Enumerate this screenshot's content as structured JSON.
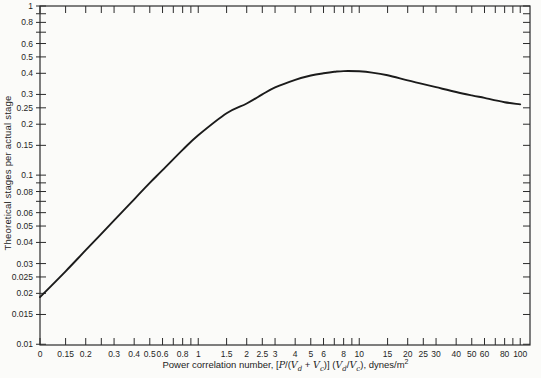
{
  "figure": {
    "y_axis_title": "Theoretical stages per actual stage",
    "x_axis_title": {
      "t1": "Power correlation number, [",
      "P1": "P",
      "t2": "/(",
      "V1": "V",
      "s1": "d",
      "t3": " + ",
      "V2": "V",
      "s2": "c",
      "t4": ")] (",
      "V3": "V",
      "s3": "d",
      "t5": "/",
      "V4": "V",
      "s4": "c",
      "t6": "), dynes/m",
      "sup2": "2"
    }
  },
  "chart_data": {
    "type": "line",
    "title": "",
    "xlabel": "Power correlation number, [P/(Vd + Vc)] (Vd/Vc), dynes/m^2",
    "ylabel": "Theoretical stages per actual stage",
    "x_scale": "log",
    "y_scale": "log",
    "xlim": [
      0.104,
      115
    ],
    "ylim": [
      0.0099,
      1.0
    ],
    "grid": false,
    "legend": "none",
    "frame": {
      "left": 40,
      "top": 6,
      "right": 530,
      "bottom": 345
    },
    "colors": {
      "background": "#fbfbf9",
      "frame": "#2b2b2b",
      "curve": "#1b1b1b",
      "text": "#1f1f1f"
    },
    "x_ticks": [
      {
        "value": 0.104,
        "label": "0"
      },
      {
        "value": 0.15,
        "label": "0.15"
      },
      {
        "value": 0.2,
        "label": "0.2"
      },
      {
        "value": 0.25,
        "label": ""
      },
      {
        "value": 0.3,
        "label": "0.3"
      },
      {
        "value": 0.4,
        "label": "0.4"
      },
      {
        "value": 0.5,
        "label": "0.5"
      },
      {
        "value": 0.6,
        "label": "0.6"
      },
      {
        "value": 0.7,
        "label": ""
      },
      {
        "value": 0.8,
        "label": "0.8"
      },
      {
        "value": 0.9,
        "label": ""
      },
      {
        "value": 1,
        "label": "1"
      },
      {
        "value": 1.5,
        "label": "1.5"
      },
      {
        "value": 2,
        "label": "2"
      },
      {
        "value": 2.5,
        "label": "2.5"
      },
      {
        "value": 3,
        "label": "3"
      },
      {
        "value": 4,
        "label": "4"
      },
      {
        "value": 5,
        "label": "5"
      },
      {
        "value": 6,
        "label": "6"
      },
      {
        "value": 7,
        "label": ""
      },
      {
        "value": 8,
        "label": "8"
      },
      {
        "value": 9,
        "label": ""
      },
      {
        "value": 10,
        "label": "10"
      },
      {
        "value": 15,
        "label": "15"
      },
      {
        "value": 20,
        "label": "20"
      },
      {
        "value": 25,
        "label": "25"
      },
      {
        "value": 30,
        "label": "30"
      },
      {
        "value": 40,
        "label": "40"
      },
      {
        "value": 50,
        "label": "50"
      },
      {
        "value": 60,
        "label": "60"
      },
      {
        "value": 70,
        "label": ""
      },
      {
        "value": 80,
        "label": "80"
      },
      {
        "value": 90,
        "label": ""
      },
      {
        "value": 100,
        "label": "100"
      }
    ],
    "y_ticks": [
      {
        "value": 1,
        "label": "1"
      },
      {
        "value": 0.9,
        "label": ""
      },
      {
        "value": 0.8,
        "label": "0.8"
      },
      {
        "value": 0.7,
        "label": ""
      },
      {
        "value": 0.6,
        "label": "0.6"
      },
      {
        "value": 0.5,
        "label": "0.5"
      },
      {
        "value": 0.4,
        "label": "0.4"
      },
      {
        "value": 0.3,
        "label": "0.3"
      },
      {
        "value": 0.25,
        "label": "0.25"
      },
      {
        "value": 0.2,
        "label": "0.2"
      },
      {
        "value": 0.15,
        "label": "0.15"
      },
      {
        "value": 0.1,
        "label": "0.1"
      },
      {
        "value": 0.09,
        "label": ""
      },
      {
        "value": 0.08,
        "label": "0.08"
      },
      {
        "value": 0.07,
        "label": ""
      },
      {
        "value": 0.06,
        "label": "0.06"
      },
      {
        "value": 0.05,
        "label": "0.05"
      },
      {
        "value": 0.04,
        "label": "0.04"
      },
      {
        "value": 0.03,
        "label": "0.03"
      },
      {
        "value": 0.025,
        "label": "0.025"
      },
      {
        "value": 0.02,
        "label": "0.02"
      },
      {
        "value": 0.015,
        "label": "0.015"
      },
      {
        "value": 0.01,
        "label": "0.01"
      }
    ],
    "series": [
      {
        "name": "theoretical-stages-curve",
        "points": [
          [
            0.104,
            0.019
          ],
          [
            0.15,
            0.027
          ],
          [
            0.2,
            0.036
          ],
          [
            0.3,
            0.054
          ],
          [
            0.4,
            0.072
          ],
          [
            0.5,
            0.09
          ],
          [
            0.6,
            0.107
          ],
          [
            0.8,
            0.141
          ],
          [
            1.0,
            0.172
          ],
          [
            1.5,
            0.232
          ],
          [
            2.0,
            0.265
          ],
          [
            2.5,
            0.3
          ],
          [
            3.0,
            0.33
          ],
          [
            4.0,
            0.366
          ],
          [
            5.0,
            0.388
          ],
          [
            6.0,
            0.4
          ],
          [
            7.0,
            0.408
          ],
          [
            8.0,
            0.412
          ],
          [
            10,
            0.411
          ],
          [
            12,
            0.404
          ],
          [
            15,
            0.39
          ],
          [
            20,
            0.363
          ],
          [
            25,
            0.345
          ],
          [
            30,
            0.331
          ],
          [
            40,
            0.31
          ],
          [
            50,
            0.296
          ],
          [
            60,
            0.286
          ],
          [
            80,
            0.27
          ],
          [
            100,
            0.262
          ]
        ]
      }
    ]
  }
}
